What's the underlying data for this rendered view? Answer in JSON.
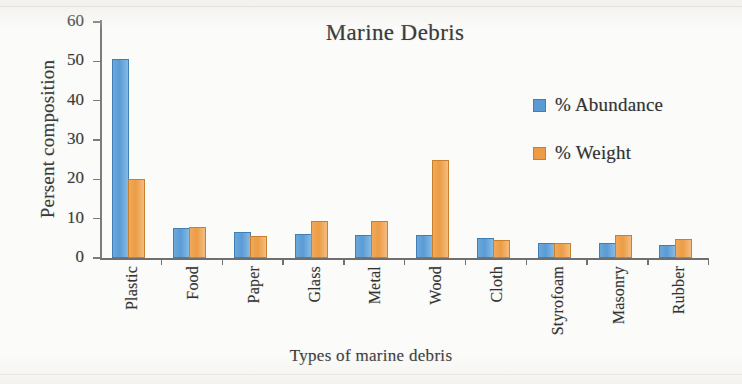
{
  "chart_data": {
    "type": "bar",
    "title": "Marine Debris",
    "xlabel": "Types of marine debris",
    "ylabel": "Persent composition",
    "categories": [
      "Plastic",
      "Food",
      "Paper",
      "Glass",
      "Metal",
      "Wood",
      "Cloth",
      "Styrofoam",
      "Masonry",
      "Rubber"
    ],
    "series": [
      {
        "name": "% Abundance",
        "color": "#5b9bd5",
        "values": [
          50.2,
          7.1,
          6.0,
          5.5,
          5.4,
          5.3,
          4.7,
          3.4,
          3.3,
          2.7
        ]
      },
      {
        "name": "% Weight",
        "color": "#ed9c45",
        "values": [
          19.6,
          7.5,
          5.1,
          9.0,
          8.9,
          24.5,
          4.1,
          3.3,
          5.4,
          4.4
        ]
      }
    ],
    "ylim": [
      0,
      60
    ],
    "yticks": [
      0,
      10,
      20,
      30,
      40,
      50,
      60
    ],
    "ytick_labels": [
      "0",
      "10",
      "20",
      "30",
      "40",
      "50",
      "60"
    ],
    "grid": false,
    "legend_position": "center-right"
  },
  "legend": {
    "entries": [
      {
        "label": "% Abundance",
        "swatch": "abundance"
      },
      {
        "label": "% Weight",
        "swatch": "weight"
      }
    ]
  }
}
